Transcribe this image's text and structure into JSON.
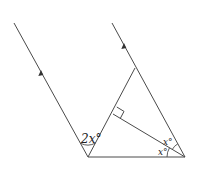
{
  "diagram": {
    "type": "geometry",
    "colors": {
      "stroke": "#4a4a4a",
      "text": "#222222",
      "background": "#ffffff"
    },
    "points": {
      "left_top": [
        14,
        23
      ],
      "left_arrow": [
        41,
        72
      ],
      "bottom_left": [
        88,
        157
      ],
      "right_top": [
        112,
        23
      ],
      "right_arrow": [
        124,
        44
      ],
      "apex": [
        135,
        68
      ],
      "bottom_right": [
        185,
        157
      ],
      "foot": [
        113,
        114
      ]
    },
    "labels": {
      "angle_left": "2x°",
      "angle_right_upper": "x°",
      "angle_right_lower": "x°"
    },
    "marks": {
      "right_angle_at": "foot",
      "parallel_arrows": 2
    }
  }
}
